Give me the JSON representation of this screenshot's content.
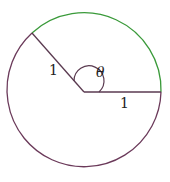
{
  "diagram": {
    "type": "circle-sector",
    "labels": {
      "radius_left": "1",
      "radius_right": "1",
      "angle": "θ"
    },
    "colors": {
      "circle": "#6b3a5a",
      "arc_highlight": "#3a9a3a",
      "radius": "#5a3a50"
    }
  }
}
